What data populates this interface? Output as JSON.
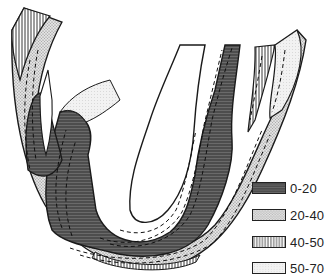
{
  "figure": {
    "type": "fold-shaped zoned diagram",
    "colors": {
      "zone_0_20": "#555555",
      "zone_20_40": "#d2d2d2",
      "zone_40_50": "#ffffff",
      "zone_50_70": "#ececec",
      "outline": "#1a1a1a"
    }
  },
  "legend": {
    "items": [
      {
        "label": "0-20",
        "pattern": "dark-horizontal-hatch"
      },
      {
        "label": "20-40",
        "pattern": "stipple"
      },
      {
        "label": "40-50",
        "pattern": "vertical-lines"
      },
      {
        "label": "50-70",
        "pattern": "light-fine-dots"
      }
    ]
  }
}
